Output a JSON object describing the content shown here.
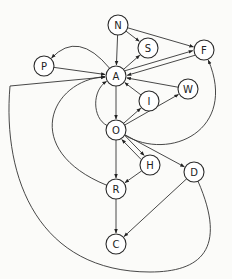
{
  "diagram": {
    "type": "directed-graph",
    "colors": {
      "stroke": "#333333",
      "node_fill": "#ffffff",
      "text": "#222222",
      "background": "#fbfbf9"
    },
    "nodes": [
      {
        "id": "N",
        "label": "N"
      },
      {
        "id": "S",
        "label": "S"
      },
      {
        "id": "F",
        "label": "F"
      },
      {
        "id": "P",
        "label": "P"
      },
      {
        "id": "A",
        "label": "A"
      },
      {
        "id": "W",
        "label": "W"
      },
      {
        "id": "I",
        "label": "I"
      },
      {
        "id": "O",
        "label": "O"
      },
      {
        "id": "H",
        "label": "H"
      },
      {
        "id": "D",
        "label": "D"
      },
      {
        "id": "R",
        "label": "R"
      },
      {
        "id": "C",
        "label": "C"
      }
    ],
    "edges": [
      {
        "from": "N",
        "to": "A"
      },
      {
        "from": "N",
        "to": "S"
      },
      {
        "from": "N",
        "to": "F"
      },
      {
        "from": "A",
        "to": "S"
      },
      {
        "from": "A",
        "to": "F"
      },
      {
        "from": "F",
        "to": "A"
      },
      {
        "from": "A",
        "to": "P"
      },
      {
        "from": "P",
        "to": "A"
      },
      {
        "from": "W",
        "to": "A"
      },
      {
        "from": "I",
        "to": "A"
      },
      {
        "from": "O",
        "to": "I"
      },
      {
        "from": "O",
        "to": "W"
      },
      {
        "from": "A",
        "to": "O"
      },
      {
        "from": "O",
        "to": "A"
      },
      {
        "from": "O",
        "to": "F"
      },
      {
        "from": "O",
        "to": "H"
      },
      {
        "from": "H",
        "to": "O"
      },
      {
        "from": "O",
        "to": "D"
      },
      {
        "from": "O",
        "to": "R"
      },
      {
        "from": "H",
        "to": "R"
      },
      {
        "from": "R",
        "to": "A"
      },
      {
        "from": "R",
        "to": "C"
      },
      {
        "from": "D",
        "to": "C"
      },
      {
        "from": "D",
        "to": "A"
      }
    ]
  }
}
